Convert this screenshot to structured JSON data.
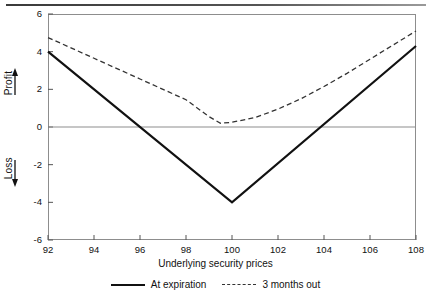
{
  "chart_data": {
    "type": "line",
    "title": "",
    "xlabel": "Underlying security prices",
    "ylabel": "Profit / Loss",
    "ylabel_top": "Profit",
    "ylabel_bottom": "Loss",
    "xlim": [
      92,
      108
    ],
    "ylim": [
      -6,
      6
    ],
    "xticks": [
      92,
      94,
      96,
      98,
      100,
      102,
      104,
      106,
      108
    ],
    "yticks": [
      6,
      4,
      2,
      0,
      -2,
      -4,
      -6
    ],
    "xtick_labels": [
      "92",
      "94",
      "96",
      "98",
      "100",
      "102",
      "104",
      "106",
      "108"
    ],
    "ytick_labels": [
      "6",
      "4",
      "2",
      "0",
      "-2",
      "-4",
      "-6"
    ],
    "grid": false,
    "zero_line": true,
    "legend_position": "below",
    "series": [
      {
        "name": "At expiration",
        "style": "solid",
        "color": "#111111",
        "x": [
          92,
          100,
          108
        ],
        "values": [
          4.0,
          -4.0,
          4.3
        ]
      },
      {
        "name": "3 months out",
        "style": "dashed",
        "color": "#333333",
        "x": [
          92,
          93,
          94,
          95,
          96,
          97,
          98,
          99,
          99.5,
          100,
          101,
          102,
          103,
          104,
          105,
          106,
          107,
          108
        ],
        "values": [
          4.75,
          4.2,
          3.65,
          3.1,
          2.55,
          2.0,
          1.45,
          0.55,
          0.2,
          0.25,
          0.5,
          0.95,
          1.5,
          2.15,
          2.85,
          3.6,
          4.35,
          5.1
        ]
      }
    ]
  },
  "axis": {
    "y_title_top": "Profit",
    "y_title_bottom": "Loss",
    "x_title": "Underlying security prices"
  },
  "legend": {
    "items": [
      {
        "label": "At expiration",
        "style": "solid"
      },
      {
        "label": "3 months out",
        "style": "dashed"
      }
    ]
  }
}
